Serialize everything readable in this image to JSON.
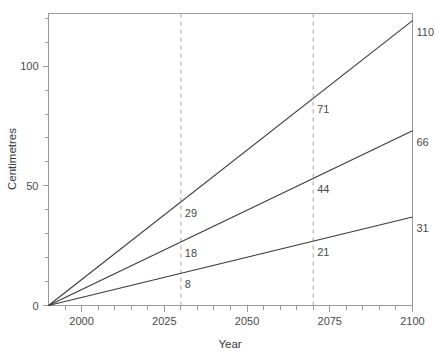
{
  "chart_data": {
    "type": "line",
    "title": "",
    "xlabel": "Year",
    "ylabel": "Centimetres",
    "xlim": [
      1990,
      2100
    ],
    "ylim": [
      0,
      122
    ],
    "grid": false,
    "legend": "none",
    "x_ticks_major": [
      2000,
      2025,
      2050,
      2075,
      2100
    ],
    "x_tick_labels": [
      "2000",
      "2025",
      "2050",
      "2075",
      "2100"
    ],
    "x_ticks_minor": [
      1995,
      2005,
      2010,
      2015,
      2020,
      2030,
      2035,
      2040,
      2045,
      2055,
      2060,
      2065,
      2070,
      2080,
      2085,
      2090,
      2095
    ],
    "y_ticks_major": [
      0,
      50,
      100
    ],
    "y_tick_labels": [
      "0",
      "50",
      "100"
    ],
    "y_ticks_minor": [
      10,
      20,
      30,
      40,
      60,
      70,
      80,
      90,
      110,
      120
    ],
    "annotation_years": [
      2030,
      2070
    ],
    "series": [
      {
        "name": "upper",
        "x": [
          1990,
          2030,
          2070,
          2100
        ],
        "values": [
          0,
          29,
          71,
          110
        ],
        "labels": [
          "",
          "29",
          "71",
          "110"
        ],
        "end_value": 119
      },
      {
        "name": "middle",
        "x": [
          1990,
          2030,
          2070,
          2100
        ],
        "values": [
          0,
          18,
          44,
          66
        ],
        "labels": [
          "",
          "18",
          "44",
          "66"
        ],
        "end_value": 73
      },
      {
        "name": "lower",
        "x": [
          1990,
          2030,
          2070,
          2100
        ],
        "values": [
          0,
          8,
          21,
          31
        ],
        "labels": [
          "",
          "8",
          "21",
          "31"
        ],
        "end_value": 37
      }
    ]
  }
}
